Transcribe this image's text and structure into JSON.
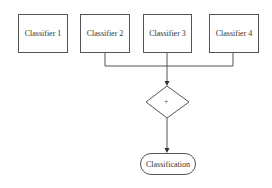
{
  "diagram": {
    "classifiers": [
      {
        "label": "Classifier 1"
      },
      {
        "label": "Classifier 2"
      },
      {
        "label": "Classifier 3"
      },
      {
        "label": "Classifier 4"
      }
    ],
    "combiner": {
      "symbol": "+"
    },
    "output": {
      "label": "Classification"
    },
    "colors": {
      "stroke": "#555555",
      "text": "#333333",
      "background": "#ffffff"
    }
  }
}
